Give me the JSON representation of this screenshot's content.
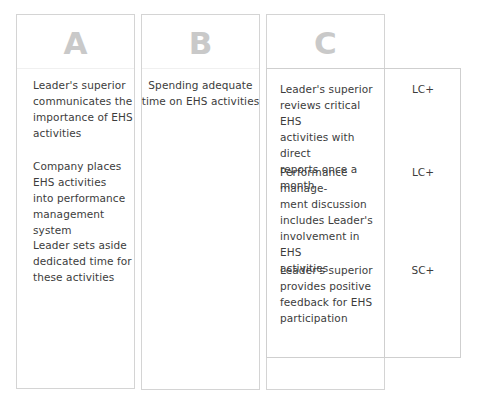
{
  "columns": [
    {
      "letter": "A",
      "items": [
        "Leader's superior\ncommunicates the\nimportance of EHS\nactivities",
        "Company places\nEHS activities\ninto performance\nmanagement system",
        "Leader sets aside\ndedicated time for\nthese activities"
      ]
    },
    {
      "letter": "B",
      "items": [
        "Spending adequate\ntime on EHS activities"
      ]
    },
    {
      "letter": "C",
      "items": [
        "Leader's superior\nreviews critical EHS\nactivities with direct\nreports once a month",
        "Performance manage-\nment discussion\nincludes Leader's\ninvolvement in EHS\nactivities",
        "Leader's superior\nprovides positive\nfeedback for EHS\nparticipation"
      ],
      "ratings": [
        "LC+",
        "LC+",
        "SC+"
      ]
    }
  ],
  "colors": {
    "letter": "#c9c9c9",
    "text": "#3c3c3c",
    "border": "#d4d4d4"
  }
}
